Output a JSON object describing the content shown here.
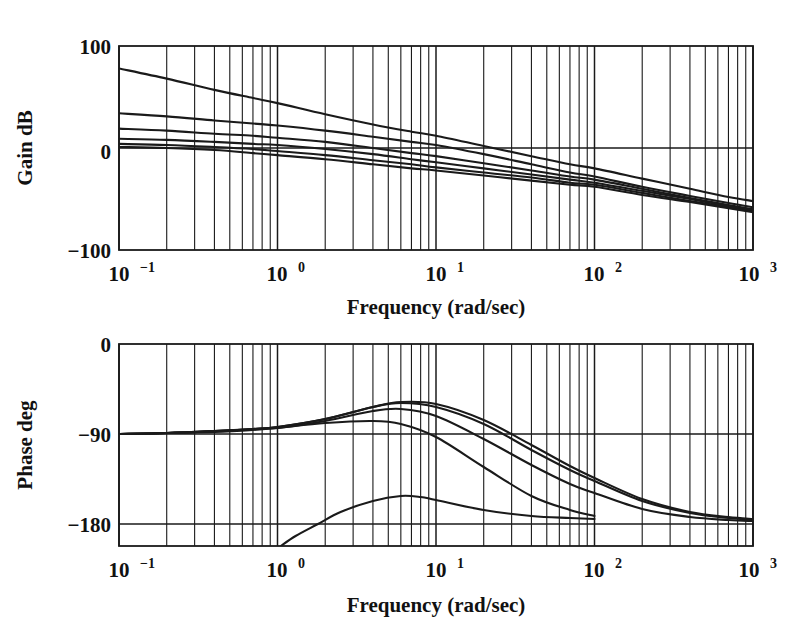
{
  "figure": {
    "title": "",
    "background": "#ffffff",
    "line_color": "#1a1a1a"
  },
  "chart_data": [
    {
      "type": "line",
      "id": "gain-plot",
      "title": "",
      "xlabel": "Frequency (rad/sec)",
      "ylabel": "Gain dB",
      "xscale": "log",
      "xlim": [
        0.1,
        1000
      ],
      "ylim": [
        -100,
        100
      ],
      "yticks": [
        -100,
        0,
        100
      ],
      "ytick_labels": [
        "−100",
        "0",
        "100"
      ],
      "xticks": [
        0.1,
        1,
        10,
        100,
        1000
      ],
      "xtick_labels": [
        "10−1",
        "10⁰",
        "10¹",
        "10²",
        "10³"
      ],
      "grid": true,
      "grid_style": "log-minor-vertical",
      "series": [
        {
          "name": "curve-1-high-gain",
          "x": [
            0.1,
            0.2,
            0.4,
            0.7,
            1,
            2,
            4,
            7,
            10,
            20,
            40,
            70,
            100,
            200,
            400,
            700,
            1000
          ],
          "y": [
            78,
            68,
            57,
            49,
            44,
            33,
            23,
            16,
            12,
            2,
            -8,
            -16,
            -20,
            -30,
            -40,
            -48,
            -52
          ]
        },
        {
          "name": "curve-2",
          "x": [
            0.1,
            0.2,
            0.4,
            0.7,
            1,
            2,
            4,
            7,
            10,
            20,
            40,
            70,
            100,
            200,
            400,
            700,
            1000
          ],
          "y": [
            34,
            31,
            27,
            24,
            22,
            17,
            11,
            6,
            3,
            -6,
            -16,
            -24,
            -28,
            -38,
            -47,
            -54,
            -58
          ]
        },
        {
          "name": "curve-3",
          "x": [
            0.1,
            0.2,
            0.4,
            0.7,
            1,
            2,
            4,
            7,
            10,
            20,
            40,
            70,
            100,
            200,
            400,
            700,
            1000
          ],
          "y": [
            19,
            17,
            14,
            12,
            10,
            6,
            0,
            -5,
            -8,
            -15,
            -22,
            -28,
            -31,
            -40,
            -49,
            -56,
            -60
          ]
        },
        {
          "name": "curve-4",
          "x": [
            0.1,
            0.2,
            0.4,
            0.7,
            1,
            2,
            4,
            7,
            10,
            20,
            40,
            70,
            100,
            200,
            400,
            700,
            1000
          ],
          "y": [
            9,
            8,
            6,
            4,
            3,
            -1,
            -6,
            -11,
            -14,
            -20,
            -26,
            -31,
            -34,
            -42,
            -50,
            -57,
            -61
          ]
        },
        {
          "name": "curve-5",
          "x": [
            0.1,
            0.2,
            0.4,
            0.7,
            1,
            2,
            4,
            7,
            10,
            20,
            40,
            70,
            100,
            200,
            400,
            700,
            1000
          ],
          "y": [
            4,
            3,
            1,
            -1,
            -3,
            -7,
            -12,
            -16,
            -19,
            -24,
            -29,
            -34,
            -36,
            -44,
            -52,
            -58,
            -62
          ]
        },
        {
          "name": "curve-6-flat",
          "x": [
            0.1,
            0.2,
            0.4,
            0.7,
            1,
            2,
            4,
            7,
            10,
            20,
            40,
            70,
            100,
            200,
            400,
            700,
            1000
          ],
          "y": [
            1,
            0,
            -2,
            -5,
            -7,
            -11,
            -16,
            -20,
            -22,
            -27,
            -32,
            -36,
            -38,
            -46,
            -53,
            -59,
            -63
          ]
        }
      ]
    },
    {
      "type": "line",
      "id": "phase-plot",
      "title": "",
      "xlabel": "Frequency (rad/sec)",
      "ylabel": "Phase deg",
      "xscale": "log",
      "xlim": [
        0.1,
        1000
      ],
      "ylim": [
        -202,
        0
      ],
      "yticks": [
        0,
        -90,
        -180
      ],
      "ytick_labels": [
        "0",
        "−90",
        "−180"
      ],
      "xticks": [
        0.1,
        1,
        10,
        100,
        1000
      ],
      "xtick_labels": [
        "10−1",
        "10⁰",
        "10¹",
        "10²",
        "10³"
      ],
      "grid": true,
      "grid_style": "log-minor-vertical",
      "series": [
        {
          "name": "phase-1-top",
          "x": [
            0.1,
            0.2,
            0.4,
            0.7,
            1,
            2,
            4,
            6,
            10,
            20,
            40,
            70,
            100,
            200,
            400,
            700,
            1000
          ],
          "y": [
            -90,
            -89,
            -87,
            -85,
            -83,
            -75,
            -63,
            -58,
            -60,
            -76,
            -101,
            -122,
            -134,
            -155,
            -168,
            -173,
            -175
          ]
        },
        {
          "name": "phase-2",
          "x": [
            0.1,
            0.2,
            0.4,
            0.7,
            1,
            2,
            4,
            6,
            10,
            20,
            40,
            70,
            100,
            200,
            400,
            700,
            1000
          ],
          "y": [
            -90,
            -89,
            -87,
            -85,
            -83,
            -75,
            -63,
            -59,
            -63,
            -80,
            -106,
            -126,
            -137,
            -157,
            -169,
            -174,
            -176
          ]
        },
        {
          "name": "phase-3",
          "x": [
            0.1,
            0.2,
            0.4,
            0.7,
            1,
            2,
            4,
            6,
            10,
            20,
            40,
            70,
            100,
            200,
            400,
            700,
            1000
          ],
          "y": [
            -90,
            -89,
            -87,
            -85,
            -84,
            -77,
            -67,
            -65,
            -72,
            -95,
            -121,
            -140,
            -149,
            -165,
            -173,
            -176,
            -177
          ]
        },
        {
          "name": "phase-4-truncated",
          "x": [
            0.1,
            0.2,
            0.4,
            0.7,
            1,
            2,
            4,
            6,
            10,
            20,
            40,
            70,
            100
          ],
          "y": [
            -90,
            -89,
            -88,
            -86,
            -84,
            -79,
            -77,
            -80,
            -93,
            -123,
            -152,
            -166,
            -172
          ],
          "truncated_at": 100
        },
        {
          "name": "phase-5-truncated",
          "x": [
            1.05,
            1.3,
            1.8,
            2.5,
            4,
            6,
            8,
            10,
            20,
            40,
            70,
            100
          ],
          "y": [
            -202,
            -192,
            -180,
            -168,
            -157,
            -152,
            -153,
            -156,
            -166,
            -172,
            -174,
            -175
          ],
          "truncated_at": 100
        }
      ]
    }
  ],
  "gain_axes": {
    "ylabel": "Gain dB",
    "xlabel": "Frequency (rad/sec)",
    "ytick_labels": [
      "100",
      "0",
      "−100"
    ],
    "xtick_bases": [
      "10",
      "10",
      "10",
      "10",
      "10"
    ],
    "xtick_exponents": [
      "−1",
      "0",
      "1",
      "2",
      "3"
    ]
  },
  "phase_axes": {
    "ylabel": "Phase deg",
    "xlabel": "Frequency (rad/sec)",
    "ytick_labels": [
      "0",
      "−90",
      "−180"
    ],
    "xtick_bases": [
      "10",
      "10",
      "10",
      "10",
      "10"
    ],
    "xtick_exponents": [
      "−1",
      "0",
      "1",
      "2",
      "3"
    ]
  }
}
